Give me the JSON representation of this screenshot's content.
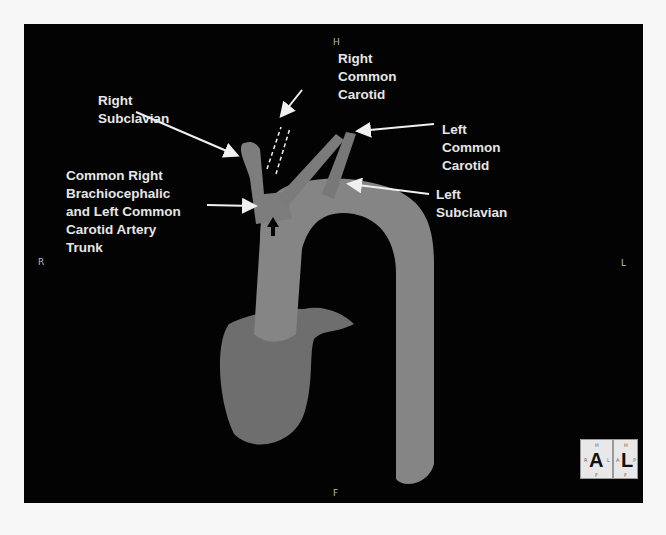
{
  "orientation": {
    "top": "H",
    "bottom": "F",
    "left": "R",
    "right": "L"
  },
  "labels": {
    "right_subclavian": "Right\nSubclavian",
    "right_common_carotid": "Right\nCommon\nCarotid",
    "left_common_carotid": "Left\nCommon\nCarotid",
    "left_subclavian": "Left\nSubclavian",
    "common_trunk": "Common Right\nBrachiocephalic\nand Left Common\nCarotid Artery\nTrunk"
  },
  "orientation_cube": {
    "front": {
      "letter": "A",
      "top": "H",
      "bottom": "F",
      "left": "R",
      "right": "L"
    },
    "side": {
      "letter": "L",
      "top": "H",
      "bottom": "F",
      "left": "A",
      "right": "P"
    }
  },
  "colors": {
    "background": "#030303",
    "vessel": "#8a8a8a",
    "text": "#e6e6e6"
  }
}
